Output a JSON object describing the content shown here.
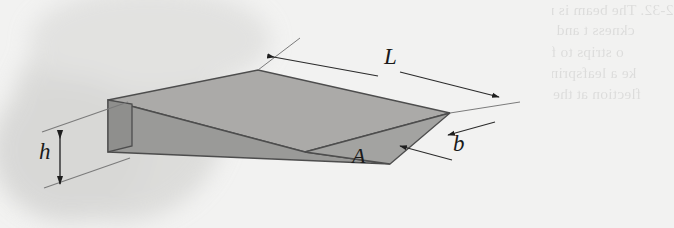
{
  "figure": {
    "kind": "engineering-diagram",
    "background_color": "#f2f2f1",
    "labels": {
      "length": "L",
      "height": "h",
      "width": "b",
      "point": "A"
    },
    "face_colors": {
      "top_face": "#a9a9a9",
      "side_face": "#9a9a9a",
      "end_face": "#8e8e8e",
      "outline": "#4a4a4a",
      "dimension_line": "#2b2b2b",
      "extension_line": "#8a8a8a",
      "smudge": "#d8d8d6"
    }
  },
  "bleedthrough": {
    "note": "faint mirrored show-through text from the reverse page",
    "lines": [
      {
        "text": "2-32.   The beam is made from a material that has a constan",
        "x": 300,
        "y": 1
      },
      {
        "text": "ckness t and a width that varies as shown. The plate is cu",
        "x": 270,
        "y": 21
      },
      {
        "text": "o strips to form a series of leaves that are stacked t",
        "x": 300,
        "y": 43
      },
      {
        "text": "ke a leafspring used for a vehicle. Determine the fl",
        "x": 312,
        "y": 64
      },
      {
        "text": "flection at the end when a load P is applied at the e",
        "x": 316,
        "y": 85
      },
      {
        "text": "the leaves.",
        "x": 352,
        "y": 106
      }
    ]
  },
  "dimensions": {
    "L": {
      "label": "L",
      "x": 387,
      "y": 46,
      "font_size": 23
    },
    "h": {
      "label": "h",
      "x": 44,
      "y": 140,
      "font_size": 23
    },
    "b": {
      "label": "b",
      "x": 457,
      "y": 140,
      "font_size": 23
    },
    "A": {
      "label": "A",
      "x": 355,
      "y": 145,
      "font_size": 22
    }
  }
}
